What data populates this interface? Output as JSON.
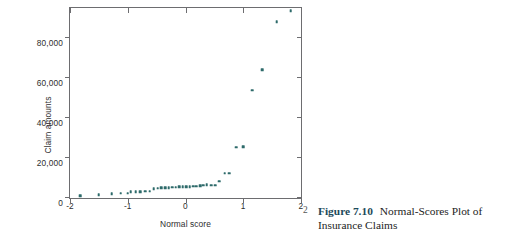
{
  "caption": {
    "figure_number": "Figure 7.10",
    "text": "Normal-Scores Plot of Insurance Claims",
    "page_number": "2",
    "figure_number_color": "#1c4a5a"
  },
  "chart_data": {
    "type": "scatter",
    "title": "Normal-Scores Plot of Insurance Claims",
    "xlabel": "Normal score",
    "ylabel": "Claim amounts",
    "xlim": [
      -2,
      2
    ],
    "ylim": [
      0,
      95000
    ],
    "grid": false,
    "legend": null,
    "marker_color": "#2d6a6a",
    "xticks": [
      -2,
      -1,
      0,
      1,
      2
    ],
    "xticklabels": [
      "-2",
      "-1",
      "0",
      "1",
      "2"
    ],
    "yticks": [
      0,
      20000,
      40000,
      60000,
      80000
    ],
    "yticklabels": [
      "0",
      "20,000",
      "40,000",
      "60,000",
      "80,000"
    ],
    "points": [
      {
        "x": -1.82,
        "y": 1100
      },
      {
        "x": -1.5,
        "y": 1700
      },
      {
        "x": -1.28,
        "y": 2100
      },
      {
        "x": -1.12,
        "y": 2300
      },
      {
        "x": -1.0,
        "y": 2400
      },
      {
        "x": -0.95,
        "y": 3000
      },
      {
        "x": -0.86,
        "y": 3100
      },
      {
        "x": -0.78,
        "y": 3200
      },
      {
        "x": -0.7,
        "y": 3300
      },
      {
        "x": -0.62,
        "y": 3400
      },
      {
        "x": -0.55,
        "y": 4700
      },
      {
        "x": -0.48,
        "y": 4900
      },
      {
        "x": -0.42,
        "y": 5000
      },
      {
        "x": -0.35,
        "y": 5100
      },
      {
        "x": -0.29,
        "y": 5200
      },
      {
        "x": -0.23,
        "y": 5300
      },
      {
        "x": -0.17,
        "y": 5400
      },
      {
        "x": -0.11,
        "y": 5500
      },
      {
        "x": -0.05,
        "y": 5500
      },
      {
        "x": 0.01,
        "y": 5600
      },
      {
        "x": 0.07,
        "y": 5700
      },
      {
        "x": 0.13,
        "y": 5800
      },
      {
        "x": 0.19,
        "y": 5900
      },
      {
        "x": 0.25,
        "y": 6100
      },
      {
        "x": 0.31,
        "y": 6300
      },
      {
        "x": 0.37,
        "y": 6500
      },
      {
        "x": 0.44,
        "y": 6400
      },
      {
        "x": 0.51,
        "y": 6300
      },
      {
        "x": 0.58,
        "y": 8300
      },
      {
        "x": 0.68,
        "y": 12300
      },
      {
        "x": 0.76,
        "y": 12400
      },
      {
        "x": 0.88,
        "y": 25400
      },
      {
        "x": 1.0,
        "y": 25500
      },
      {
        "x": 1.15,
        "y": 53800
      },
      {
        "x": 1.33,
        "y": 64000
      },
      {
        "x": 1.58,
        "y": 88000
      },
      {
        "x": 1.82,
        "y": 93500
      }
    ]
  }
}
